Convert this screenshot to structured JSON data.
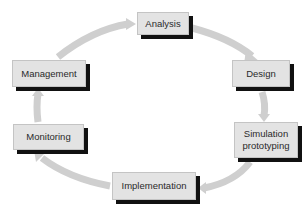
{
  "diagram": {
    "type": "cycle",
    "direction": "clockwise",
    "colors": {
      "box_fill": "#e3e3e3",
      "box_shadow": "#111111",
      "arrow": "#cfcfcf",
      "text": "#2a2a2a"
    },
    "nodes": [
      {
        "id": "analysis",
        "label": "Analysis"
      },
      {
        "id": "design",
        "label": "Design"
      },
      {
        "id": "simulation",
        "label": "Simulation prototyping"
      },
      {
        "id": "implementation",
        "label": "Implementation"
      },
      {
        "id": "monitoring",
        "label": "Monitoring"
      },
      {
        "id": "management",
        "label": "Management"
      }
    ],
    "edges": [
      {
        "from": "analysis",
        "to": "design"
      },
      {
        "from": "design",
        "to": "simulation"
      },
      {
        "from": "simulation",
        "to": "implementation"
      },
      {
        "from": "implementation",
        "to": "monitoring"
      },
      {
        "from": "monitoring",
        "to": "management"
      },
      {
        "from": "management",
        "to": "analysis"
      }
    ]
  }
}
